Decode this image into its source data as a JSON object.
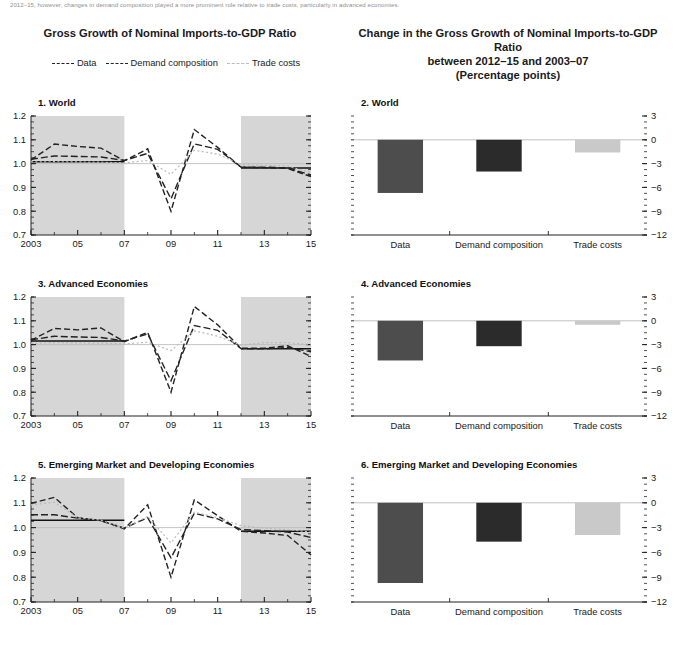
{
  "note": "2012–15, however, changes in demand composition played a more prominent role relative to trade costs, particularly in advanced economies.",
  "titles": {
    "left": "Gross Growth of Nominal Imports-to-GDP Ratio",
    "right_line1": "Change in the Gross Growth of Nominal Imports-to-GDP Ratio",
    "right_line2": "between 2012–15 and 2003–07",
    "right_line3": "(Percentage points)"
  },
  "legend": {
    "items": [
      {
        "label": "Data",
        "style": "dashed",
        "color": "#222222"
      },
      {
        "label": "Demand composition",
        "style": "dashed",
        "color": "#222222"
      },
      {
        "label": "Trade costs",
        "style": "dashed",
        "color": "#b9b9b9"
      }
    ]
  },
  "colors": {
    "data_bar": "#4d4d4d",
    "demand_bar": "#2b2b2b",
    "trade_bar": "#c9c9c9",
    "shade_band": "#d6d6d6",
    "axis": "#222222",
    "zero_line": "#c0c0c0"
  },
  "panel_labels": {
    "p1": "1. World",
    "p2": "2. World",
    "p3": "3. Advanced Economies",
    "p4": "4. Advanced Economies",
    "p5": "5. Emerging Market and Developing Economies",
    "p6": "6. Emerging Market and Developing Economies"
  },
  "chart_data": [
    {
      "id": "panel1",
      "type": "line",
      "title": "1. World",
      "xlabel": "",
      "ylabel": "",
      "xlim": [
        2003,
        2015
      ],
      "ylim": [
        0.7,
        1.2
      ],
      "ytick_labels": [
        "0.7",
        "0.8",
        "0.9",
        "1.0",
        "1.1",
        "1.2"
      ],
      "yticks": [
        0.7,
        0.8,
        0.9,
        1.0,
        1.1,
        1.2
      ],
      "x": [
        2003,
        2004,
        2005,
        2006,
        2007,
        2008,
        2009,
        2010,
        2011,
        2012,
        2013,
        2014,
        2015
      ],
      "xtick_labels": [
        "2003",
        "05",
        "07",
        "09",
        "11",
        "13",
        "15"
      ],
      "xticks": [
        2003,
        2005,
        2007,
        2009,
        2011,
        2013,
        2015
      ],
      "shaded_spans": [
        [
          2003,
          2007
        ],
        [
          2012,
          2015
        ]
      ],
      "grid": false,
      "legend_position": "top",
      "series": [
        {
          "name": "Data",
          "style": "dashed",
          "color": "#222222",
          "values": [
            1.015,
            1.082,
            1.072,
            1.065,
            1.012,
            1.062,
            0.8,
            1.143,
            1.068,
            0.985,
            0.983,
            0.98,
            0.945
          ]
        },
        {
          "name": "Demand composition",
          "style": "dashed",
          "color": "#222222",
          "values": [
            1.018,
            1.032,
            1.03,
            1.028,
            1.013,
            1.043,
            0.852,
            1.083,
            1.06,
            0.985,
            0.985,
            0.982,
            0.952
          ]
        },
        {
          "name": "Trade costs",
          "style": "dashed",
          "color": "#b9b9b9",
          "values": [
            1.007,
            1.008,
            1.007,
            1.006,
            1.003,
            1.013,
            0.955,
            1.056,
            1.04,
            0.995,
            0.993,
            0.99,
            0.962
          ]
        }
      ],
      "reference_lines": [
        {
          "name": "2003-07 average",
          "y": 1.008,
          "x_from": 2003,
          "x_to": 2007,
          "color": "#111111"
        },
        {
          "name": "2012-15 average",
          "y": 0.982,
          "x_from": 2012,
          "x_to": 2015,
          "color": "#111111"
        },
        {
          "name": "unity",
          "y": 1.0,
          "x_from": 2003,
          "x_to": 2015,
          "color": "#bdbdbd"
        }
      ]
    },
    {
      "id": "panel2",
      "type": "bar",
      "title": "2. World",
      "categories": [
        "Data",
        "Demand composition",
        "Trade costs"
      ],
      "values": [
        -6.7,
        -4.0,
        -1.6
      ],
      "bar_colors": [
        "#4d4d4d",
        "#2b2b2b",
        "#c9c9c9"
      ],
      "ylim": [
        -12,
        3
      ],
      "yticks": [
        3,
        0,
        -3,
        -6,
        -9,
        -12
      ],
      "ytick_labels": [
        "3",
        "0",
        "−3",
        "−6",
        "−9",
        "−12"
      ],
      "xlabel": "",
      "ylabel": "",
      "grid": false
    },
    {
      "id": "panel3",
      "type": "line",
      "title": "3. Advanced Economies",
      "xlim": [
        2003,
        2015
      ],
      "ylim": [
        0.7,
        1.2
      ],
      "ytick_labels": [
        "0.7",
        "0.8",
        "0.9",
        "1.0",
        "1.1",
        "1.2"
      ],
      "yticks": [
        0.7,
        0.8,
        0.9,
        1.0,
        1.1,
        1.2
      ],
      "x": [
        2003,
        2004,
        2005,
        2006,
        2007,
        2008,
        2009,
        2010,
        2011,
        2012,
        2013,
        2014,
        2015
      ],
      "xtick_labels": [
        "2003",
        "05",
        "07",
        "09",
        "11",
        "13",
        "15"
      ],
      "xticks": [
        2003,
        2005,
        2007,
        2009,
        2011,
        2013,
        2015
      ],
      "shaded_spans": [
        [
          2003,
          2007
        ],
        [
          2012,
          2015
        ]
      ],
      "grid": false,
      "series": [
        {
          "name": "Data",
          "style": "dashed",
          "color": "#222222",
          "values": [
            1.018,
            1.068,
            1.062,
            1.07,
            1.012,
            1.052,
            0.8,
            1.16,
            1.083,
            0.985,
            0.985,
            0.995,
            0.95
          ]
        },
        {
          "name": "Demand composition",
          "style": "dashed",
          "color": "#222222",
          "values": [
            1.02,
            1.035,
            1.032,
            1.03,
            1.015,
            1.045,
            0.848,
            1.08,
            1.06,
            0.983,
            0.982,
            0.988,
            0.97
          ]
        },
        {
          "name": "Trade costs",
          "style": "dashed",
          "color": "#b9b9b9",
          "values": [
            1.005,
            1.008,
            1.007,
            1.006,
            1.003,
            1.01,
            0.975,
            1.058,
            1.035,
            0.998,
            1.008,
            1.008,
            1.0
          ]
        }
      ],
      "reference_lines": [
        {
          "name": "2003-07 average",
          "y": 1.015,
          "x_from": 2003,
          "x_to": 2007,
          "color": "#111111"
        },
        {
          "name": "2012-15 average",
          "y": 0.983,
          "x_from": 2012,
          "x_to": 2015,
          "color": "#111111"
        },
        {
          "name": "unity",
          "y": 1.0,
          "x_from": 2003,
          "x_to": 2015,
          "color": "#bdbdbd"
        }
      ]
    },
    {
      "id": "panel4",
      "type": "bar",
      "title": "4. Advanced Economies",
      "categories": [
        "Data",
        "Demand composition",
        "Trade costs"
      ],
      "values": [
        -5.0,
        -3.2,
        -0.5
      ],
      "bar_colors": [
        "#4d4d4d",
        "#2b2b2b",
        "#c9c9c9"
      ],
      "ylim": [
        -12,
        3
      ],
      "yticks": [
        3,
        0,
        -3,
        -6,
        -9,
        -12
      ],
      "ytick_labels": [
        "3",
        "0",
        "−3",
        "−6",
        "−9",
        "−12"
      ],
      "xlabel": "",
      "ylabel": "",
      "grid": false
    },
    {
      "id": "panel5",
      "type": "line",
      "title": "5. Emerging Market and Developing Economies",
      "xlim": [
        2003,
        2015
      ],
      "ylim": [
        0.7,
        1.2
      ],
      "ytick_labels": [
        "0.7",
        "0.8",
        "0.9",
        "1.0",
        "1.1",
        "1.2"
      ],
      "yticks": [
        0.7,
        0.8,
        0.9,
        1.0,
        1.1,
        1.2
      ],
      "x": [
        2003,
        2004,
        2005,
        2006,
        2007,
        2008,
        2009,
        2010,
        2011,
        2012,
        2013,
        2014,
        2015
      ],
      "xtick_labels": [
        "2003",
        "05",
        "07",
        "09",
        "11",
        "13",
        "15"
      ],
      "xticks": [
        2003,
        2005,
        2007,
        2009,
        2011,
        2013,
        2015
      ],
      "shaded_spans": [
        [
          2003,
          2007
        ],
        [
          2012,
          2015
        ]
      ],
      "grid": false,
      "series": [
        {
          "name": "Data",
          "style": "dashed",
          "color": "#222222",
          "values": [
            1.098,
            1.122,
            1.04,
            1.028,
            0.995,
            1.092,
            0.8,
            1.112,
            1.048,
            0.985,
            0.978,
            0.968,
            0.89
          ]
        },
        {
          "name": "Demand composition",
          "style": "dashed",
          "color": "#222222",
          "values": [
            1.052,
            1.052,
            1.038,
            1.028,
            0.998,
            1.04,
            0.878,
            1.058,
            1.035,
            0.992,
            0.988,
            0.982,
            0.96
          ]
        },
        {
          "name": "Trade costs",
          "style": "dashed",
          "color": "#b9b9b9",
          "values": [
            1.092,
            1.102,
            1.04,
            1.03,
            0.998,
            1.045,
            0.938,
            1.062,
            1.04,
            1.008,
            0.998,
            0.992,
            0.982
          ]
        }
      ],
      "reference_lines": [
        {
          "name": "2003-07 average",
          "y": 1.03,
          "x_from": 2003,
          "x_to": 2007,
          "color": "#111111"
        },
        {
          "name": "2012-15 average",
          "y": 0.985,
          "x_from": 2012,
          "x_to": 2015,
          "color": "#111111"
        },
        {
          "name": "unity",
          "y": 1.0,
          "x_from": 2003,
          "x_to": 2015,
          "color": "#bdbdbd"
        }
      ]
    },
    {
      "id": "panel6",
      "type": "bar",
      "title": "6. Emerging Market and Developing Economies",
      "categories": [
        "Data",
        "Demand composition",
        "Trade costs"
      ],
      "values": [
        -9.7,
        -4.7,
        -3.9
      ],
      "bar_colors": [
        "#4d4d4d",
        "#2b2b2b",
        "#c9c9c9"
      ],
      "ylim": [
        -12,
        3
      ],
      "yticks": [
        3,
        0,
        -3,
        -6,
        -9,
        -12
      ],
      "ytick_labels": [
        "3",
        "0",
        "−3",
        "−6",
        "−9",
        "−12"
      ],
      "xlabel": "",
      "ylabel": "",
      "grid": false
    }
  ]
}
